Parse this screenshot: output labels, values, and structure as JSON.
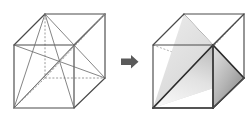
{
  "figure": {
    "background_color": "#ffffff",
    "width": 252,
    "height": 122,
    "panels": [
      {
        "id": "left-cube",
        "label": "cube-with-diagonals",
        "description": "Wireframe cube showing all face and space diagonals converging at the center",
        "shaded": false
      },
      {
        "id": "right-cube",
        "label": "cube-with-inscribed-tetrahedron",
        "description": "Same wireframe cube with a shaded tetrahedron inscribed inside",
        "shaded": true
      }
    ],
    "arrow": {
      "name": "right-arrow",
      "direction": "right",
      "color": "#5a5a5a"
    },
    "colors": {
      "visible_edge": "#4a4a4a",
      "hidden_edge": "#8e8e8e",
      "diagonal": "#6e6e6e",
      "tetrahedron_edge": "#2b2b2b",
      "tetra_face_left_light": "#f2f2f2",
      "tetra_face_left_dark": "#c4c4c4",
      "tetra_face_right_light": "#d8d8d8",
      "tetra_face_right_dark": "#8a8a8a",
      "arrow": "#5a5a5a"
    },
    "geometry": {
      "left_cube_vertices": {
        "front_top_left": [
          14,
          45
        ],
        "front_top_right": [
          74,
          45
        ],
        "front_bottom_left": [
          14,
          108
        ],
        "front_bottom_right": [
          74,
          108
        ],
        "back_top_left": [
          45,
          14
        ],
        "back_top_right": [
          105,
          14
        ],
        "back_bottom_left": [
          45,
          78
        ],
        "back_bottom_right": [
          105,
          78
        ]
      },
      "right_cube_vertices": {
        "front_top_left": [
          153,
          45
        ],
        "front_top_right": [
          213,
          45
        ],
        "front_bottom_left": [
          153,
          108
        ],
        "front_bottom_right": [
          213,
          108
        ],
        "back_top_left": [
          184,
          14
        ],
        "back_top_right": [
          244,
          14
        ],
        "back_bottom_left": [
          184,
          78
        ],
        "back_bottom_right": [
          244,
          78
        ]
      },
      "tetrahedron_vertices": [
        "back_top_left",
        "front_bottom_left",
        "front_top_right",
        "back_bottom_right"
      ]
    }
  }
}
